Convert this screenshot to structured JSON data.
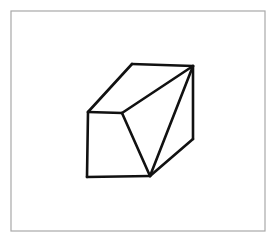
{
  "page": {
    "width": 277,
    "height": 242,
    "background_color": "#ffffff"
  },
  "frame": {
    "name": "image-border-frame",
    "x": 11,
    "y": 11,
    "width": 254,
    "height": 220,
    "stroke_color": "#a8a8a8",
    "stroke_width": 1.2,
    "fill": "none"
  },
  "figure": {
    "label": "cube-wireframe",
    "stroke_color": "#111111",
    "stroke_width": 2.6,
    "fill_color": "#ffffff",
    "vertices": {
      "top_back_left": {
        "x": 132,
        "y": 64
      },
      "top_back_right": {
        "x": 193,
        "y": 66
      },
      "top_front_left": {
        "x": 88,
        "y": 112
      },
      "top_front_mid": {
        "x": 122,
        "y": 113
      },
      "bottom_front_left": {
        "x": 87,
        "y": 177
      },
      "bottom_front_mid": {
        "x": 150,
        "y": 176
      },
      "bottom_back_right": {
        "x": 193,
        "y": 139
      }
    },
    "faces": [
      {
        "name": "top-face",
        "points": "88,112 132,64 193,66 122,113",
        "fill": "#ffffff"
      },
      {
        "name": "front-face",
        "points": "88,112 122,113 150,176 87,177",
        "fill": "#ffffff"
      },
      {
        "name": "right-face",
        "points": "122,113 193,66 193,139 150,176",
        "fill": "#ffffff"
      }
    ],
    "edges": [
      {
        "name": "edge-top-front-left-to-top-back-left",
        "x1": 88,
        "y1": 112,
        "x2": 132,
        "y2": 64
      },
      {
        "name": "edge-top-back-left-to-top-back-right",
        "x1": 132,
        "y1": 64,
        "x2": 193,
        "y2": 66
      },
      {
        "name": "edge-top-back-right-to-bottom-back-right",
        "x1": 193,
        "y1": 66,
        "x2": 193,
        "y2": 139
      },
      {
        "name": "edge-bottom-back-right-to-bottom-front-mid",
        "x1": 193,
        "y1": 139,
        "x2": 150,
        "y2": 176
      },
      {
        "name": "edge-bottom-front-mid-to-bottom-front-left",
        "x1": 150,
        "y1": 176,
        "x2": 87,
        "y2": 177
      },
      {
        "name": "edge-bottom-front-left-to-top-front-left",
        "x1": 87,
        "y1": 177,
        "x2": 88,
        "y2": 112
      },
      {
        "name": "edge-top-front-left-to-top-front-mid",
        "x1": 88,
        "y1": 112,
        "x2": 122,
        "y2": 113
      },
      {
        "name": "edge-top-front-mid-to-bottom-front-mid",
        "x1": 122,
        "y1": 113,
        "x2": 150,
        "y2": 176
      },
      {
        "name": "diagonal-top-front-mid-to-top-back-right",
        "x1": 122,
        "y1": 113,
        "x2": 193,
        "y2": 66
      },
      {
        "name": "diagonal-bottom-front-mid-to-top-back-right",
        "x1": 150,
        "y1": 176,
        "x2": 193,
        "y2": 66
      }
    ]
  }
}
